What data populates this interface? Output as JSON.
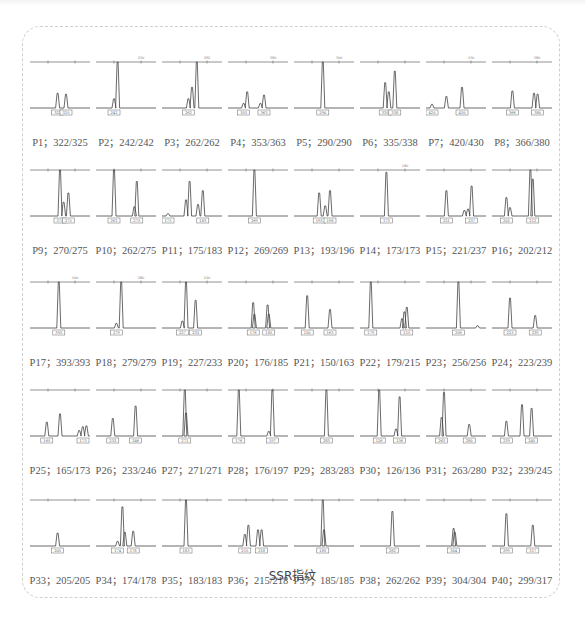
{
  "figure": {
    "caption": "SSR指纹",
    "panels": [
      {
        "id": "P1",
        "label": "P1；322/325",
        "alleles": [
          322,
          325
        ],
        "top_tick": "",
        "peaks": [
          [
            0.46,
            0.32
          ],
          [
            0.6,
            0.3
          ]
        ]
      },
      {
        "id": "P2",
        "label": "P2；242/242",
        "alleles": [
          242,
          242
        ],
        "top_tick": "250",
        "peaks": [
          [
            0.36,
            1.0
          ],
          [
            0.3,
            0.2
          ]
        ]
      },
      {
        "id": "P3",
        "label": "P3；262/262",
        "alleles": [
          262,
          262
        ],
        "top_tick": "262",
        "peaks": [
          [
            0.58,
            1.0
          ],
          [
            0.5,
            0.45
          ],
          [
            0.44,
            0.2
          ]
        ]
      },
      {
        "id": "P4",
        "label": "P4；353/363",
        "alleles": [
          353,
          363
        ],
        "top_tick": "360",
        "peaks": [
          [
            0.32,
            0.35
          ],
          [
            0.6,
            0.28
          ],
          [
            0.26,
            0.1
          ],
          [
            0.54,
            0.1
          ]
        ]
      },
      {
        "id": "P5",
        "label": "P5；290/290",
        "alleles": [
          290,
          290
        ],
        "top_tick": "300",
        "peaks": [
          [
            0.48,
            1.0
          ]
        ]
      },
      {
        "id": "P6",
        "label": "P6；335/338",
        "alleles": [
          335,
          338
        ],
        "top_tick": "",
        "peaks": [
          [
            0.42,
            0.55
          ],
          [
            0.48,
            0.35
          ],
          [
            0.58,
            0.8
          ]
        ]
      },
      {
        "id": "P7",
        "label": "P7；420/430",
        "alleles": [
          420,
          430
        ],
        "top_tick": "430",
        "peaks": [
          [
            0.34,
            0.25
          ],
          [
            0.6,
            0.45
          ],
          [
            0.1,
            0.08
          ]
        ]
      },
      {
        "id": "P8",
        "label": "P8；366/380",
        "alleles": [
          366,
          380
        ],
        "top_tick": "380",
        "peaks": [
          [
            0.34,
            0.37
          ],
          [
            0.7,
            0.32
          ],
          [
            0.76,
            0.3
          ]
        ]
      },
      {
        "id": "P9",
        "label": "P9；270/275",
        "alleles": [
          270,
          275
        ],
        "top_tick": "",
        "peaks": [
          [
            0.5,
            1.0
          ],
          [
            0.56,
            0.3
          ],
          [
            0.64,
            0.5
          ]
        ]
      },
      {
        "id": "P10",
        "label": "P10；262/275",
        "alleles": [
          262,
          275
        ],
        "top_tick": "",
        "peaks": [
          [
            0.3,
            1.0
          ],
          [
            0.68,
            0.75
          ],
          [
            0.64,
            0.2
          ]
        ]
      },
      {
        "id": "P11",
        "label": "P11；175/183",
        "alleles": [
          175,
          183
        ],
        "top_tick": "",
        "peaks": [
          [
            0.46,
            0.75
          ],
          [
            0.4,
            0.35
          ],
          [
            0.68,
            0.55
          ],
          [
            0.6,
            0.25
          ],
          [
            0.1,
            0.05
          ]
        ]
      },
      {
        "id": "P12",
        "label": "P12；269/269",
        "alleles": [
          269,
          269
        ],
        "top_tick": "",
        "peaks": [
          [
            0.44,
            1.0
          ]
        ]
      },
      {
        "id": "P13",
        "label": "P13；193/196",
        "alleles": [
          193,
          196
        ],
        "top_tick": "",
        "peaks": [
          [
            0.42,
            0.5
          ],
          [
            0.6,
            0.55
          ],
          [
            0.52,
            0.22
          ]
        ]
      },
      {
        "id": "P14",
        "label": "P14；173/173",
        "alleles": [
          173,
          173
        ],
        "top_tick": "180",
        "peaks": [
          [
            0.44,
            0.95
          ]
        ]
      },
      {
        "id": "P15",
        "label": "P15；221/237",
        "alleles": [
          221,
          237
        ],
        "top_tick": "",
        "peaks": [
          [
            0.34,
            0.55
          ],
          [
            0.76,
            0.65
          ],
          [
            0.64,
            0.12
          ],
          [
            0.7,
            0.15
          ]
        ]
      },
      {
        "id": "P16",
        "label": "P16；202/212",
        "alleles": [
          202,
          212
        ],
        "top_tick": "",
        "peaks": [
          [
            0.24,
            0.4
          ],
          [
            0.64,
            1.0
          ],
          [
            0.68,
            0.8
          ],
          [
            0.3,
            0.18
          ]
        ]
      },
      {
        "id": "P17",
        "label": "P17；393/393",
        "alleles": [
          393,
          393
        ],
        "top_tick": "400",
        "peaks": [
          [
            0.48,
            1.0
          ]
        ]
      },
      {
        "id": "P18",
        "label": "P18；279/279",
        "alleles": [
          279,
          279
        ],
        "top_tick": "280",
        "peaks": [
          [
            0.42,
            1.0
          ],
          [
            0.34,
            0.1
          ]
        ]
      },
      {
        "id": "P19",
        "label": "P19；227/233",
        "alleles": [
          227,
          233
        ],
        "top_tick": "240",
        "peaks": [
          [
            0.4,
            1.0
          ],
          [
            0.56,
            0.6
          ],
          [
            0.34,
            0.15
          ]
        ]
      },
      {
        "id": "P20",
        "label": "P20；176/185",
        "alleles": [
          176,
          185
        ],
        "top_tick": "",
        "peaks": [
          [
            0.42,
            0.55
          ],
          [
            0.66,
            0.5
          ],
          [
            0.44,
            0.3
          ],
          [
            0.68,
            0.3
          ]
        ]
      },
      {
        "id": "P21",
        "label": "P21；150/163",
        "alleles": [
          150,
          163
        ],
        "top_tick": "",
        "peaks": [
          [
            0.22,
            0.7
          ],
          [
            0.6,
            0.4
          ]
        ]
      },
      {
        "id": "P22",
        "label": "P22；179/215",
        "alleles": [
          179,
          215
        ],
        "top_tick": "",
        "peaks": [
          [
            0.18,
            1.0
          ],
          [
            0.74,
            0.35
          ],
          [
            0.78,
            0.45
          ],
          [
            0.7,
            0.2
          ]
        ]
      },
      {
        "id": "P23",
        "label": "P23；256/256",
        "alleles": [
          256,
          256
        ],
        "top_tick": "",
        "peaks": [
          [
            0.54,
            1.0
          ],
          [
            0.86,
            0.05
          ]
        ]
      },
      {
        "id": "P24",
        "label": "P24；223/239",
        "alleles": [
          223,
          239
        ],
        "top_tick": "",
        "peaks": [
          [
            0.3,
            0.65
          ],
          [
            0.72,
            0.27
          ]
        ]
      },
      {
        "id": "P25",
        "label": "P25；165/173",
        "alleles": [
          165,
          173
        ],
        "top_tick": "",
        "peaks": [
          [
            0.28,
            0.3
          ],
          [
            0.5,
            0.48
          ],
          [
            0.88,
            0.2
          ],
          [
            0.94,
            0.22
          ],
          [
            0.82,
            0.12
          ]
        ]
      },
      {
        "id": "P26",
        "label": "P26；233/246",
        "alleles": [
          233,
          246
        ],
        "top_tick": "",
        "peaks": [
          [
            0.28,
            0.38
          ],
          [
            0.66,
            0.65
          ]
        ]
      },
      {
        "id": "P27",
        "label": "P27；271/271",
        "alleles": [
          271,
          271
        ],
        "top_tick": "",
        "peaks": [
          [
            0.38,
            1.0
          ],
          [
            0.4,
            0.5
          ]
        ]
      },
      {
        "id": "P28",
        "label": "P28；176/197",
        "alleles": [
          176,
          197
        ],
        "top_tick": "",
        "peaks": [
          [
            0.18,
            1.0
          ],
          [
            0.74,
            1.0
          ],
          [
            0.68,
            0.1
          ]
        ]
      },
      {
        "id": "P29",
        "label": "P29；283/283",
        "alleles": [
          283,
          283
        ],
        "top_tick": "",
        "peaks": [
          [
            0.54,
            1.0
          ]
        ]
      },
      {
        "id": "P30",
        "label": "P30；126/136",
        "alleles": [
          126,
          136
        ],
        "top_tick": "",
        "peaks": [
          [
            0.32,
            1.0
          ],
          [
            0.66,
            0.85
          ],
          [
            0.6,
            0.15
          ]
        ]
      },
      {
        "id": "P31",
        "label": "P31；263/280",
        "alleles": [
          263,
          280
        ],
        "top_tick": "",
        "peaks": [
          [
            0.3,
            0.95
          ],
          [
            0.72,
            0.25
          ],
          [
            0.26,
            0.4
          ]
        ]
      },
      {
        "id": "P32",
        "label": "P32；239/245",
        "alleles": [
          239,
          245
        ],
        "top_tick": "",
        "peaks": [
          [
            0.24,
            0.32
          ],
          [
            0.5,
            0.68
          ],
          [
            0.66,
            0.6
          ]
        ]
      },
      {
        "id": "P33",
        "label": "P33；205/205",
        "alleles": [
          205,
          205
        ],
        "top_tick": "",
        "peaks": [
          [
            0.46,
            0.28
          ]
        ]
      },
      {
        "id": "P34",
        "label": "P34；174/178",
        "alleles": [
          174,
          178
        ],
        "top_tick": "",
        "peaks": [
          [
            0.44,
            0.85
          ],
          [
            0.48,
            0.3
          ],
          [
            0.62,
            0.32
          ],
          [
            0.36,
            0.1
          ]
        ]
      },
      {
        "id": "P35",
        "label": "P35；183/183",
        "alleles": [
          183,
          183
        ],
        "top_tick": "",
        "peaks": [
          [
            0.4,
            1.0
          ]
        ]
      },
      {
        "id": "P36",
        "label": "P36；215/218",
        "alleles": [
          215,
          218
        ],
        "top_tick": "",
        "peaks": [
          [
            0.34,
            0.45
          ],
          [
            0.28,
            0.25
          ],
          [
            0.5,
            0.35
          ],
          [
            0.56,
            0.35
          ]
        ]
      },
      {
        "id": "P37",
        "label": "P37；185/185",
        "alleles": [
          185,
          185
        ],
        "top_tick": "",
        "peaks": [
          [
            0.48,
            1.0
          ],
          [
            0.5,
            0.35
          ]
        ]
      },
      {
        "id": "P38",
        "label": "P38；262/262",
        "alleles": [
          262,
          262
        ],
        "top_tick": "",
        "peaks": [
          [
            0.54,
            0.75
          ]
        ]
      },
      {
        "id": "P39",
        "label": "P39；304/304",
        "alleles": [
          304,
          304
        ],
        "top_tick": "",
        "peaks": [
          [
            0.46,
            0.38
          ],
          [
            0.48,
            0.3
          ]
        ]
      },
      {
        "id": "P40",
        "label": "P40；299/317",
        "alleles": [
          299,
          317
        ],
        "top_tick": "",
        "peaks": [
          [
            0.24,
            0.7
          ],
          [
            0.68,
            0.45
          ]
        ]
      }
    ]
  },
  "chart_data": {
    "type": "table",
    "title": "SSR指纹",
    "columns": [
      "primer",
      "allele_1",
      "allele_2"
    ],
    "rows": [
      [
        "P1",
        322,
        325
      ],
      [
        "P2",
        242,
        242
      ],
      [
        "P3",
        262,
        262
      ],
      [
        "P4",
        353,
        363
      ],
      [
        "P5",
        290,
        290
      ],
      [
        "P6",
        335,
        338
      ],
      [
        "P7",
        420,
        430
      ],
      [
        "P8",
        366,
        380
      ],
      [
        "P9",
        270,
        275
      ],
      [
        "P10",
        262,
        275
      ],
      [
        "P11",
        175,
        183
      ],
      [
        "P12",
        269,
        269
      ],
      [
        "P13",
        193,
        196
      ],
      [
        "P14",
        173,
        173
      ],
      [
        "P15",
        221,
        237
      ],
      [
        "P16",
        202,
        212
      ],
      [
        "P17",
        393,
        393
      ],
      [
        "P18",
        279,
        279
      ],
      [
        "P19",
        227,
        233
      ],
      [
        "P20",
        176,
        185
      ],
      [
        "P21",
        150,
        163
      ],
      [
        "P22",
        179,
        215
      ],
      [
        "P23",
        256,
        256
      ],
      [
        "P24",
        223,
        239
      ],
      [
        "P25",
        165,
        173
      ],
      [
        "P26",
        233,
        246
      ],
      [
        "P27",
        271,
        271
      ],
      [
        "P28",
        176,
        197
      ],
      [
        "P29",
        283,
        283
      ],
      [
        "P30",
        126,
        136
      ],
      [
        "P31",
        263,
        280
      ],
      [
        "P32",
        239,
        245
      ],
      [
        "P33",
        205,
        205
      ],
      [
        "P34",
        174,
        178
      ],
      [
        "P35",
        183,
        183
      ],
      [
        "P36",
        215,
        218
      ],
      [
        "P37",
        185,
        185
      ],
      [
        "P38",
        262,
        262
      ],
      [
        "P39",
        304,
        304
      ],
      [
        "P40",
        299,
        317
      ]
    ],
    "layout": {
      "grid_rows": 5,
      "grid_cols": 8
    }
  }
}
